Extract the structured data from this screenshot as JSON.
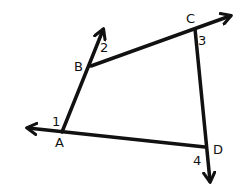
{
  "diagram": {
    "type": "quadrilateral-exterior-angles",
    "line_color": "#111111",
    "background": "#ffffff",
    "vertices": [
      {
        "name": "A",
        "label": "A",
        "x": 62,
        "y": 132
      },
      {
        "name": "B",
        "label": "B",
        "x": 91,
        "y": 66
      },
      {
        "name": "C",
        "label": "C",
        "x": 195,
        "y": 29
      },
      {
        "name": "D",
        "label": "D",
        "x": 205,
        "y": 147
      }
    ],
    "angles": [
      {
        "label": "1",
        "at": "A"
      },
      {
        "label": "2",
        "at": "B"
      },
      {
        "label": "3",
        "at": "C"
      },
      {
        "label": "4",
        "at": "D"
      }
    ],
    "rays": [
      {
        "from": "A",
        "through": "B",
        "arrow_at": "beyond B"
      },
      {
        "from": "B",
        "through": "C",
        "arrow_at": "beyond C"
      },
      {
        "from": "C",
        "through": "D",
        "arrow_at": "beyond D"
      },
      {
        "from": "D",
        "through": "A",
        "arrow_at": "beyond A"
      }
    ]
  }
}
